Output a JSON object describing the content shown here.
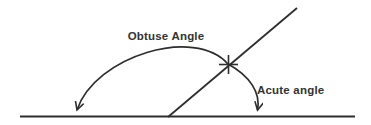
{
  "colors": {
    "line": "#2e2e2e",
    "text": "#333333",
    "background": "#ffffff"
  },
  "diagram": {
    "obtuse_label": "Obtuse Angle",
    "acute_label": "Acute angle"
  }
}
